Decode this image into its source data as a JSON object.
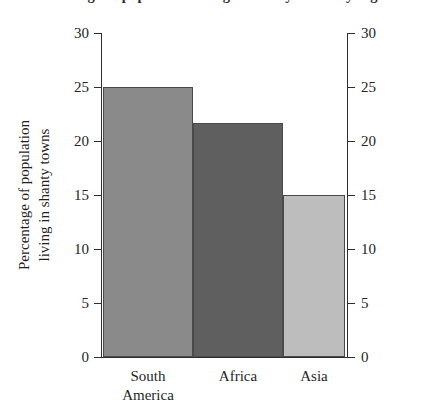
{
  "chart_data": {
    "type": "bar",
    "title": "Percentage of population living in shanty towns by region",
    "categories": [
      "South America",
      "Africa",
      "Asia"
    ],
    "category_lines": [
      [
        "South",
        "America"
      ],
      [
        "Africa"
      ],
      [
        "Asia"
      ]
    ],
    "values": [
      25,
      21.7,
      15
    ],
    "xlabel": "",
    "ylabel": "Percentage of population living in shanty towns",
    "ylabel_lines": [
      "Percentage of population",
      "living in shanty towns"
    ],
    "ylim": [
      0,
      30
    ],
    "ytick_labels": [
      "30",
      "25",
      "20",
      "15",
      "10",
      "5",
      "0"
    ],
    "ytick_values": [
      30,
      25,
      20,
      15,
      10,
      5,
      0
    ],
    "grid": false,
    "legend": null,
    "axes": [
      "left",
      "right"
    ],
    "bar_colors": [
      "#8a8a8a",
      "#5f5f5f",
      "#bdbdbd"
    ],
    "bar_edge_color": "#4a4a4a",
    "axis_color": "#2e2e2e",
    "background_color": "#ffffff"
  }
}
